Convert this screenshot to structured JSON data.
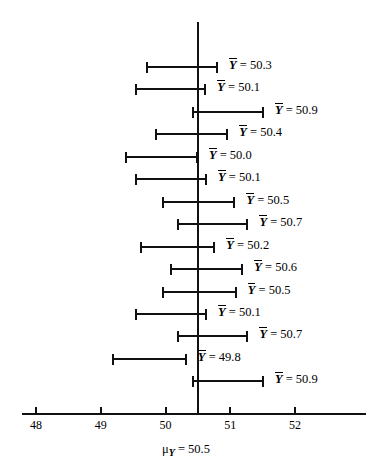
{
  "chart_data": {
    "type": "scatter",
    "plot_kind": "confidence-interval-plot",
    "title": "",
    "subtitle": "",
    "xlabel": "",
    "ylabel": "",
    "xlim": [
      47.6,
      53.0
    ],
    "grid": false,
    "legend": null,
    "x_ticks": [
      48,
      49,
      50,
      51,
      52
    ],
    "x_tick_labels": [
      "48",
      "49",
      "50",
      "51",
      "52"
    ],
    "reference_line": {
      "value": 50.5,
      "label": "μ",
      "label_subscript": "Y",
      "label_equals": "= 50.5",
      "label_full": "μ Y = 50.5"
    },
    "label_prefix": "Y",
    "label_separator": "=",
    "intervals": [
      {
        "index": 1,
        "mean": 50.3,
        "lower": 49.7,
        "upper": 50.81,
        "label_value": "50.3",
        "label_text": "Y = 50.3",
        "contains_mu": true
      },
      {
        "index": 2,
        "mean": 50.1,
        "lower": 49.53,
        "upper": 50.63,
        "label_value": "50.1",
        "label_text": "Y = 50.1",
        "contains_mu": true
      },
      {
        "index": 3,
        "mean": 50.9,
        "lower": 50.41,
        "upper": 51.52,
        "label_value": "50.9",
        "label_text": "Y = 50.9",
        "contains_mu": true
      },
      {
        "index": 4,
        "mean": 50.4,
        "lower": 49.84,
        "upper": 50.97,
        "label_value": "50.4",
        "label_text": "Y = 50.4",
        "contains_mu": true
      },
      {
        "index": 5,
        "mean": 50.0,
        "lower": 49.37,
        "upper": 50.5,
        "label_value": "50.0",
        "label_text": "Y = 50.0",
        "contains_mu": true
      },
      {
        "index": 6,
        "mean": 50.1,
        "lower": 49.53,
        "upper": 50.64,
        "label_value": "50.1",
        "label_text": "Y = 50.1",
        "contains_mu": true
      },
      {
        "index": 7,
        "mean": 50.5,
        "lower": 49.95,
        "upper": 51.08,
        "label_value": "50.5",
        "label_text": "Y = 50.5",
        "contains_mu": true
      },
      {
        "index": 8,
        "mean": 50.7,
        "lower": 50.18,
        "upper": 51.28,
        "label_value": "50.7",
        "label_text": "Y = 50.7",
        "contains_mu": true
      },
      {
        "index": 9,
        "mean": 50.2,
        "lower": 49.61,
        "upper": 50.77,
        "label_value": "50.2",
        "label_text": "Y = 50.2",
        "contains_mu": true
      },
      {
        "index": 10,
        "mean": 50.6,
        "lower": 50.07,
        "upper": 51.2,
        "label_value": "50.6",
        "label_text": "Y = 50.6",
        "contains_mu": true
      },
      {
        "index": 11,
        "mean": 50.5,
        "lower": 49.95,
        "upper": 51.1,
        "label_value": "50.5",
        "label_text": "Y = 50.5",
        "contains_mu": true
      },
      {
        "index": 12,
        "mean": 50.1,
        "lower": 49.53,
        "upper": 50.64,
        "label_value": "50.1",
        "label_text": "Y = 50.1",
        "contains_mu": true
      },
      {
        "index": 13,
        "mean": 50.7,
        "lower": 50.18,
        "upper": 51.28,
        "label_value": "50.7",
        "label_text": "Y = 50.7",
        "contains_mu": true
      },
      {
        "index": 14,
        "mean": 49.8,
        "lower": 49.17,
        "upper": 50.33,
        "label_value": "49.8",
        "label_text": "Y = 49.8",
        "contains_mu": false
      },
      {
        "index": 15,
        "mean": 50.9,
        "lower": 50.41,
        "upper": 51.52,
        "label_value": "50.9",
        "label_text": "Y = 50.9",
        "contains_mu": true
      }
    ]
  }
}
